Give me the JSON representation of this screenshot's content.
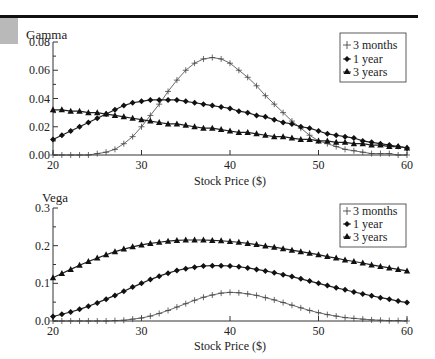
{
  "chart_data": [
    {
      "type": "line",
      "title": "Gamma",
      "ylabel": "Gamma",
      "xlabel": "Stock Price ($)",
      "xlim": [
        20,
        60
      ],
      "ylim": [
        0,
        0.08
      ],
      "xticks": [
        "20",
        "30",
        "40",
        "50",
        "60"
      ],
      "yticks": [
        "0.00",
        "0.02",
        "0.04",
        "0.06",
        "0.08"
      ],
      "grid": false,
      "legend_position": "top-right",
      "x": [
        20,
        21,
        22,
        23,
        24,
        25,
        26,
        27,
        28,
        29,
        30,
        31,
        32,
        33,
        34,
        35,
        36,
        37,
        38,
        39,
        40,
        41,
        42,
        43,
        44,
        45,
        46,
        47,
        48,
        49,
        50,
        51,
        52,
        53,
        54,
        55,
        56,
        57,
        58,
        59,
        60
      ],
      "series": [
        {
          "name": "3 months",
          "marker": "plus",
          "values": [
            0.0,
            0.0,
            0.0,
            0.0,
            0.0,
            0.001,
            0.002,
            0.004,
            0.008,
            0.013,
            0.02,
            0.028,
            0.036,
            0.045,
            0.053,
            0.06,
            0.065,
            0.068,
            0.069,
            0.068,
            0.065,
            0.06,
            0.055,
            0.049,
            0.042,
            0.036,
            0.03,
            0.024,
            0.019,
            0.014,
            0.01,
            0.008,
            0.006,
            0.004,
            0.003,
            0.002,
            0.001,
            0.001,
            0.001,
            0.0,
            0.0
          ]
        },
        {
          "name": "1 year",
          "marker": "diamond",
          "values": [
            0.011,
            0.014,
            0.017,
            0.02,
            0.023,
            0.026,
            0.029,
            0.032,
            0.035,
            0.037,
            0.038,
            0.039,
            0.039,
            0.039,
            0.039,
            0.038,
            0.037,
            0.036,
            0.035,
            0.034,
            0.033,
            0.031,
            0.03,
            0.028,
            0.027,
            0.025,
            0.023,
            0.022,
            0.02,
            0.019,
            0.017,
            0.015,
            0.014,
            0.013,
            0.012,
            0.01,
            0.009,
            0.008,
            0.007,
            0.006,
            0.005
          ]
        },
        {
          "name": "3 years",
          "marker": "triangle",
          "values": [
            0.032,
            0.032,
            0.031,
            0.031,
            0.03,
            0.03,
            0.029,
            0.028,
            0.027,
            0.026,
            0.025,
            0.024,
            0.023,
            0.022,
            0.022,
            0.021,
            0.02,
            0.019,
            0.019,
            0.018,
            0.017,
            0.016,
            0.016,
            0.015,
            0.014,
            0.013,
            0.013,
            0.012,
            0.011,
            0.011,
            0.01,
            0.01,
            0.009,
            0.009,
            0.008,
            0.008,
            0.007,
            0.007,
            0.006,
            0.006,
            0.005
          ]
        }
      ]
    },
    {
      "type": "line",
      "title": "Vega",
      "ylabel": "Vega",
      "xlabel": "Stock Price ($)",
      "xlim": [
        20,
        60
      ],
      "ylim": [
        0,
        0.3
      ],
      "xticks": [
        "20",
        "30",
        "40",
        "50",
        "60"
      ],
      "yticks": [
        "0.0",
        "0.1",
        "0.2",
        "0.3"
      ],
      "grid": false,
      "legend_position": "top-right",
      "x": [
        20,
        21,
        22,
        23,
        24,
        25,
        26,
        27,
        28,
        29,
        30,
        31,
        32,
        33,
        34,
        35,
        36,
        37,
        38,
        39,
        40,
        41,
        42,
        43,
        44,
        45,
        46,
        47,
        48,
        49,
        50,
        51,
        52,
        53,
        54,
        55,
        56,
        57,
        58,
        59,
        60
      ],
      "series": [
        {
          "name": "3 months",
          "marker": "plus",
          "values": [
            0.0,
            0.0,
            0.0,
            0.0,
            0.0,
            0.0,
            0.0,
            0.001,
            0.002,
            0.005,
            0.008,
            0.013,
            0.02,
            0.028,
            0.037,
            0.046,
            0.055,
            0.063,
            0.069,
            0.074,
            0.076,
            0.075,
            0.072,
            0.068,
            0.062,
            0.056,
            0.049,
            0.042,
            0.035,
            0.028,
            0.022,
            0.017,
            0.013,
            0.009,
            0.007,
            0.005,
            0.003,
            0.002,
            0.001,
            0.001,
            0.0
          ]
        },
        {
          "name": "1 year",
          "marker": "diamond",
          "values": [
            0.012,
            0.018,
            0.024,
            0.031,
            0.039,
            0.048,
            0.058,
            0.068,
            0.079,
            0.09,
            0.1,
            0.11,
            0.119,
            0.127,
            0.134,
            0.139,
            0.143,
            0.146,
            0.147,
            0.147,
            0.146,
            0.144,
            0.141,
            0.137,
            0.133,
            0.128,
            0.123,
            0.118,
            0.112,
            0.106,
            0.1,
            0.094,
            0.088,
            0.083,
            0.077,
            0.072,
            0.067,
            0.062,
            0.058,
            0.053,
            0.049
          ]
        },
        {
          "name": "3 years",
          "marker": "triangle",
          "values": [
            0.115,
            0.126,
            0.137,
            0.148,
            0.158,
            0.167,
            0.176,
            0.184,
            0.191,
            0.197,
            0.202,
            0.206,
            0.209,
            0.212,
            0.214,
            0.215,
            0.215,
            0.215,
            0.214,
            0.213,
            0.211,
            0.209,
            0.206,
            0.203,
            0.199,
            0.196,
            0.192,
            0.188,
            0.184,
            0.18,
            0.176,
            0.171,
            0.167,
            0.162,
            0.158,
            0.154,
            0.149,
            0.145,
            0.141,
            0.137,
            0.133
          ]
        }
      ]
    }
  ],
  "panels": [
    {
      "ylabel": "Gamma",
      "xlabel": "Stock Price ($)",
      "legend": [
        "3 months",
        "1 year",
        "3 years"
      ]
    },
    {
      "ylabel": "Vega",
      "xlabel": "Stock Price ($)",
      "legend": [
        "3 months",
        "1 year",
        "3 years"
      ]
    }
  ]
}
